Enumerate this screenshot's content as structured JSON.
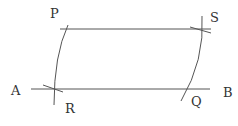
{
  "diagram": {
    "type": "geometric-construction",
    "labels": {
      "P": "P",
      "S": "S",
      "A": "A",
      "B": "B",
      "R": "R",
      "Q": "Q"
    },
    "points": {
      "P": [
        68,
        29
      ],
      "S": [
        201,
        29
      ],
      "R": [
        54,
        89
      ],
      "Q": [
        186,
        89
      ],
      "A": [
        31,
        89
      ],
      "B": [
        210,
        89
      ]
    },
    "segments": [
      {
        "name": "line-PS",
        "from": [
          60,
          29
        ],
        "to": [
          211,
          29
        ]
      },
      {
        "name": "line-AB",
        "from": [
          31,
          89
        ],
        "to": [
          210,
          89
        ]
      }
    ],
    "arcs": [
      {
        "name": "arc-RP",
        "path": "M 54 105 Q 54 55 68 25"
      },
      {
        "name": "arc-QS",
        "path": "M 181 101 Q 205 60 202 16"
      }
    ],
    "ticks": [
      {
        "name": "tick-R",
        "from": [
          43,
          85
        ],
        "to": [
          63,
          92
        ]
      },
      {
        "name": "tick-S",
        "from": [
          190,
          27
        ],
        "to": [
          211,
          33
        ]
      }
    ],
    "colors": {
      "line": "#555555",
      "text": "#333333",
      "background": "#ffffff"
    }
  }
}
